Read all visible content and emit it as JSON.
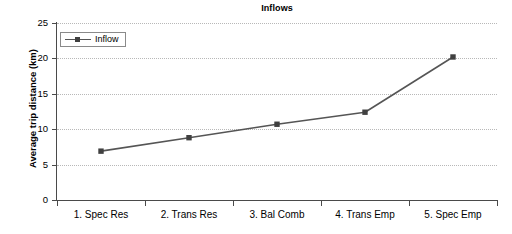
{
  "chart_data": {
    "type": "line",
    "title": "Inflows",
    "xlabel": "",
    "ylabel": "Average trip distance (km)",
    "categories": [
      "1. Spec Res",
      "2. Trans Res",
      "3. Bal Comb",
      "4. Trans Emp",
      "5. Spec Emp"
    ],
    "series": [
      {
        "name": "Inflow",
        "values": [
          6.9,
          8.8,
          10.7,
          12.4,
          20.2
        ]
      }
    ],
    "ylim": [
      0,
      25
    ],
    "ytick_labels": [
      "0",
      "5",
      "10",
      "15",
      "20",
      "25"
    ],
    "ytick_values": [
      0,
      5,
      10,
      15,
      20,
      25
    ],
    "grid": "horizontal-dotted",
    "legend_position": "top-left-inside",
    "marker": "square",
    "colors": {
      "series_line": "#555555",
      "marker": "#404040",
      "axis": "#4a4a4a",
      "gridline": "#b8b8b8",
      "text": "#000000",
      "background": "#ffffff"
    }
  },
  "legend": {
    "entries": [
      {
        "label": "Inflow",
        "marker_icon": "square-marker-icon"
      }
    ]
  }
}
